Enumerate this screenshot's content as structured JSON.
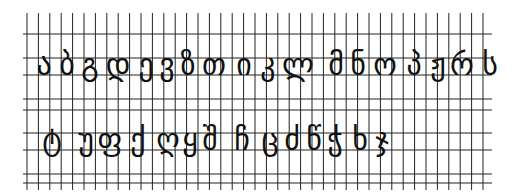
{
  "sheet": {
    "title": "Georgian Mkhedruli alphabet handwriting practice grid",
    "ink_color": "#111111",
    "grid_color": "#222222",
    "background": "#ffffff"
  },
  "grid": {
    "x_start": 27,
    "x_end": 490,
    "col_spacing": 11.4,
    "y_top": 13,
    "y_bottom": 190,
    "h_lines": [
      34,
      58,
      75,
      99,
      110,
      133,
      150,
      174,
      183
    ]
  },
  "rows": [
    {
      "name": "row-1",
      "baseline": 75,
      "letters": [
        {
          "char": "ა",
          "x": 44
        },
        {
          "char": "ბ",
          "x": 67
        },
        {
          "char": "გ",
          "x": 90
        },
        {
          "char": "დ",
          "x": 118
        },
        {
          "char": "ე",
          "x": 146
        },
        {
          "char": "ვ",
          "x": 167
        },
        {
          "char": "ზ",
          "x": 188
        },
        {
          "char": "თ",
          "x": 214
        },
        {
          "char": "ი",
          "x": 244
        },
        {
          "char": "კ",
          "x": 268
        },
        {
          "char": "ლ",
          "x": 298
        },
        {
          "char": "მ",
          "x": 336
        },
        {
          "char": "ნ",
          "x": 358
        },
        {
          "char": "ო",
          "x": 385
        },
        {
          "char": "პ",
          "x": 414
        },
        {
          "char": "ჟ",
          "x": 438
        },
        {
          "char": "რ",
          "x": 462
        },
        {
          "char": "ს",
          "x": 490
        }
      ]
    },
    {
      "name": "row-2",
      "baseline": 150,
      "letters": [
        {
          "char": "ტ",
          "x": 52
        },
        {
          "char": "უ",
          "x": 86
        },
        {
          "char": "ფ",
          "x": 110
        },
        {
          "char": "ქ",
          "x": 138
        },
        {
          "char": "ღ",
          "x": 168
        },
        {
          "char": "ყ",
          "x": 190
        },
        {
          "char": "შ",
          "x": 210
        },
        {
          "char": "ჩ",
          "x": 242
        },
        {
          "char": "ც",
          "x": 270
        },
        {
          "char": "ძ",
          "x": 292
        },
        {
          "char": "წ",
          "x": 314
        },
        {
          "char": "ჭ",
          "x": 335
        },
        {
          "char": "ხ",
          "x": 360
        },
        {
          "char": "ჯ",
          "x": 382
        }
      ]
    }
  ]
}
